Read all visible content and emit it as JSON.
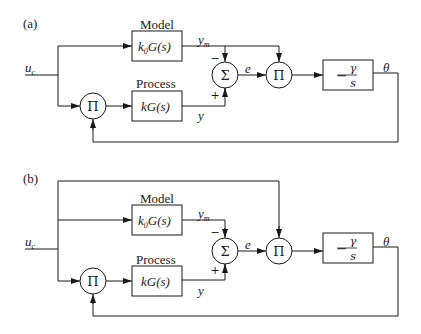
{
  "diagrams": [
    {
      "panel_label": "(a)",
      "input_label": "u",
      "input_sub": "c",
      "model_title": "Model",
      "model_tf_k": "k",
      "model_tf_k_sub": "0",
      "model_tf": "G(s)",
      "process_title": "Process",
      "process_tf": "kG(s)",
      "model_output": "y",
      "model_output_sub": "m",
      "process_output": "y",
      "sum_symbol": "Σ",
      "sum_minus": "−",
      "sum_plus": "+",
      "error_label": "e",
      "product_symbol": "Π",
      "integrator_sign": "−",
      "integrator_num": "γ",
      "integrator_den": "s",
      "output_label": "θ"
    },
    {
      "panel_label": "(b)",
      "input_label": "u",
      "input_sub": "c",
      "model_title": "Model",
      "model_tf_k": "k",
      "model_tf_k_sub": "0",
      "model_tf": "G(s)",
      "process_title": "Process",
      "process_tf": "kG(s)",
      "model_output": "y",
      "model_output_sub": "m",
      "process_output": "y",
      "sum_symbol": "Σ",
      "sum_minus": "−",
      "sum_plus": "+",
      "error_label": "e",
      "product_symbol": "Π",
      "integrator_sign": "−",
      "integrator_num": "γ",
      "integrator_den": "s",
      "output_label": "θ"
    }
  ]
}
